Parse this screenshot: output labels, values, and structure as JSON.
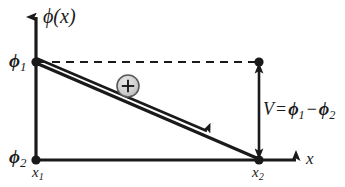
{
  "figure": {
    "type": "diagram",
    "background_color": "#ffffff",
    "stroke_color": "#1a1a1a",
    "charge_fill_color": "#c9c9c9",
    "charge_stroke_color": "#555555",
    "axes": {
      "y_axis_label": "ϕ(x)",
      "x_axis_label": "x",
      "origin_px": {
        "x": 36,
        "y": 160
      }
    },
    "labels": {
      "phi_axis": {
        "text": "ϕ(x)",
        "name": "phi-of-x"
      },
      "phi1": {
        "symbol": "ϕ",
        "subscript": "1",
        "name": "phi-one"
      },
      "phi2": {
        "symbol": "ϕ",
        "subscript": "2",
        "name": "phi-two"
      },
      "x1": {
        "symbol": "x",
        "subscript": "1",
        "name": "x-one"
      },
      "x2": {
        "symbol": "x",
        "subscript": "2",
        "name": "x-two"
      },
      "x_axis": {
        "text": "x",
        "name": "x-axis-label"
      }
    },
    "equation": {
      "lhs": "V",
      "equals": "=",
      "term1_symbol": "ϕ",
      "term1_sub": "1",
      "minus": "−",
      "term2_symbol": "ϕ",
      "term2_sub": "2",
      "plain": "V = ϕ1 − ϕ2"
    },
    "charge": {
      "sign": "+",
      "center_px": {
        "x": 128,
        "y": 86
      },
      "radius_px": 11
    },
    "elements": {
      "potential_line_label": "potential profile line",
      "drift_arrow_label": "charge drift direction",
      "dashed_reference_label": "dashed reference level at phi1",
      "voltage_measure_label": "voltage difference double arrow"
    },
    "geometry": {
      "phi1_point": {
        "x": 36,
        "y": 62
      },
      "phi2_point": {
        "x": 36,
        "y": 160
      },
      "x2_top_point": {
        "x": 259,
        "y": 62
      },
      "x2_bottom_point": {
        "x": 259,
        "y": 160
      },
      "y_axis_top": {
        "x": 36,
        "y": 12
      },
      "x_axis_right": {
        "x": 300,
        "y": 160
      }
    }
  }
}
